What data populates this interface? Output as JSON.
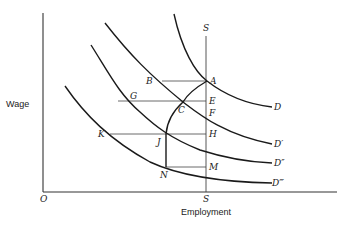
{
  "axes": {
    "y_label": "Wage",
    "x_label": "Employment",
    "origin_label": "O"
  },
  "supply": {
    "top_label": "S",
    "bottom_label": "S"
  },
  "curves": {
    "D": "D",
    "D1": "D′",
    "D2": "D″",
    "D3": "D‴"
  },
  "points": {
    "A": "A",
    "B": "B",
    "C": "C",
    "E": "E",
    "F": "F",
    "G": "G",
    "H": "H",
    "J": "J",
    "K": "K",
    "M": "M",
    "N": "N"
  }
}
